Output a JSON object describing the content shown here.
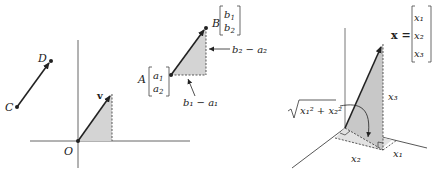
{
  "panels": {
    "left": {
      "points": {
        "C": {
          "label": "C",
          "x": 17,
          "y": 107
        },
        "D": {
          "label": "D",
          "x": 51,
          "y": 61
        },
        "O": {
          "label": "O",
          "x": 78,
          "y": 141
        },
        "v_tip": {
          "x": 112,
          "y": 94
        },
        "A": {
          "label": "A",
          "x": 171,
          "y": 75
        },
        "B": {
          "label": "B",
          "x": 206,
          "y": 28
        }
      },
      "vector_label": "v",
      "A_vec": [
        "a",
        "a"
      ],
      "A_sub": [
        "1",
        "2"
      ],
      "B_vec": [
        "b",
        "b"
      ],
      "B_sub": [
        "1",
        "2"
      ],
      "horizontal_diff": "b₁ − a₁",
      "vertical_diff": "b₂ − a₂"
    },
    "right": {
      "vector_label": "x =",
      "components": [
        "x₁",
        "x₂",
        "x₃"
      ],
      "height_label": "x₃",
      "axis_label_x1": "x₁",
      "axis_label_x2": "x₂",
      "norm_label_prefix": "√",
      "norm_label": "x₁² + x₂²"
    }
  },
  "colors": {
    "line": "#222222",
    "shade": "#d4d4d4",
    "shade_dark": "#c4c4c4"
  }
}
